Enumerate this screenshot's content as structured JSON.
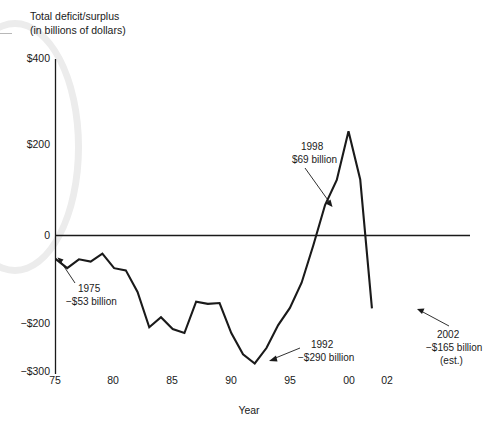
{
  "chart_data": {
    "type": "line",
    "title": "Total deficit/surplus",
    "subtitle": "(in billions of dollars)",
    "xlabel": "Year",
    "ylabel": "",
    "ylim": [
      -300,
      400
    ],
    "xlim": [
      1975,
      2002
    ],
    "grid": false,
    "legend": null,
    "ytick_labels": [
      "$400",
      "$200",
      "0",
      "−$200",
      "−$300"
    ],
    "ytick_values": [
      400,
      200,
      0,
      -200,
      -300
    ],
    "xtick_labels": [
      "75",
      "80",
      "85",
      "90",
      "95",
      "00",
      "02"
    ],
    "xtick_values": [
      1975,
      1980,
      1985,
      1990,
      1995,
      2000,
      2002
    ],
    "x": [
      1975,
      1976,
      1977,
      1978,
      1979,
      1980,
      1981,
      1982,
      1983,
      1984,
      1985,
      1986,
      1987,
      1988,
      1989,
      1990,
      1991,
      1992,
      1993,
      1994,
      1995,
      1996,
      1997,
      1998,
      1999,
      2000,
      2001,
      2002
    ],
    "values": [
      -53,
      -74,
      -54,
      -59,
      -41,
      -74,
      -79,
      -128,
      -208,
      -185,
      -212,
      -221,
      -150,
      -155,
      -153,
      -221,
      -269,
      -290,
      -255,
      -203,
      -164,
      -107,
      -22,
      69,
      126,
      236,
      127,
      -165
    ],
    "series": [
      {
        "name": "Total deficit/surplus",
        "values": [
          -53,
          -74,
          -54,
          -59,
          -41,
          -74,
          -79,
          -128,
          -208,
          -185,
          -212,
          -221,
          -150,
          -155,
          -153,
          -221,
          -269,
          -290,
          -255,
          -203,
          -164,
          -107,
          -22,
          69,
          126,
          236,
          127,
          -165
        ]
      }
    ],
    "annotations": [
      {
        "id": "a1975",
        "year": "1975",
        "value": "−$53 billion",
        "note": ""
      },
      {
        "id": "a1998",
        "year": "1998",
        "value": "$69 billion",
        "note": ""
      },
      {
        "id": "a1992",
        "year": "1992",
        "value": "−$290 billion",
        "note": ""
      },
      {
        "id": "a2002",
        "year": "2002",
        "value": "−$165 billion",
        "note": "(est.)"
      }
    ],
    "colors": {
      "line": "#1a1a1a",
      "axis": "#1a1a1a",
      "background": "#ffffff"
    }
  }
}
